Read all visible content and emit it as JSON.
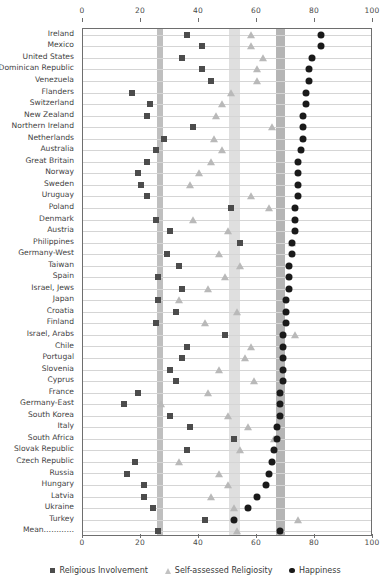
{
  "chart_data": {
    "type": "scatter",
    "title": "",
    "xlabel": "",
    "ylabel": "",
    "xlim": [
      0,
      100
    ],
    "xticks": [
      0,
      20,
      40,
      60,
      80,
      100
    ],
    "grid": true,
    "legend_position": "bottom",
    "orientation": "horizontal-dot-plot",
    "categories": [
      "Ireland",
      "Mexico",
      "United States",
      "Dominican Republic",
      "Venezuela",
      "Flanders",
      "Switzerland",
      "New Zealand",
      "Northern Ireland",
      "Netherlands",
      "Australia",
      "Great Britain",
      "Norway",
      "Sweden",
      "Uruguay",
      "Poland",
      "Denmark",
      "Austria",
      "Philippines",
      "Germany-West",
      "Taiwan",
      "Spain",
      "Israel, Jews",
      "Japan",
      "Croatia",
      "Finland",
      "Israel, Arabs",
      "Chile",
      "Portugal",
      "Slovenia",
      "Cyprus",
      "France",
      "Germany-East",
      "South Korea",
      "Italy",
      "South Africa",
      "Slovak Republic",
      "Czech Republic",
      "Russia",
      "Hungary",
      "Latvia",
      "Ukraine",
      "Turkey",
      "Mean…………"
    ],
    "series": [
      {
        "name": "Religious Involvement",
        "marker": "square",
        "color": "#4c4c4c",
        "values": [
          36,
          41,
          34,
          41,
          44,
          17,
          23,
          22,
          38,
          28,
          25,
          22,
          19,
          20,
          22,
          51,
          25,
          30,
          54,
          29,
          33,
          26,
          34,
          26,
          32,
          25,
          49,
          36,
          34,
          30,
          32,
          19,
          14,
          30,
          37,
          52,
          36,
          18,
          15,
          21,
          21,
          24,
          42,
          26
        ]
      },
      {
        "name": "Self-assessed Religiosity",
        "marker": "triangle",
        "color": "#b9b9b9",
        "values": [
          58,
          58,
          62,
          60,
          60,
          51,
          48,
          46,
          65,
          45,
          48,
          44,
          40,
          37,
          58,
          64,
          38,
          50,
          72,
          47,
          54,
          49,
          43,
          33,
          53,
          42,
          73,
          58,
          56,
          47,
          59,
          43,
          27,
          50,
          57,
          66,
          54,
          33,
          47,
          50,
          44,
          52,
          74,
          53
        ]
      },
      {
        "name": "Happiness",
        "marker": "circle",
        "color": "#1a1a1a",
        "values": [
          82,
          82,
          79,
          78,
          78,
          77,
          77,
          76,
          76,
          76,
          75,
          74,
          74,
          74,
          74,
          73,
          73,
          73,
          72,
          72,
          71,
          71,
          71,
          70,
          70,
          70,
          69,
          69,
          69,
          69,
          69,
          68,
          68,
          68,
          67,
          67,
          66,
          65,
          64,
          63,
          60,
          57,
          52,
          68
        ]
      }
    ],
    "bands": [
      {
        "name": "religious-involvement-mean-band",
        "from": 25.5,
        "to": 27.5,
        "shade": "dark"
      },
      {
        "name": "self-assessed-religiosity-mean-band",
        "from": 50.5,
        "to": 54.0,
        "shade": "light"
      },
      {
        "name": "happiness-mean-band",
        "from": 66.5,
        "to": 69.5,
        "shade": "mid"
      }
    ]
  },
  "legend": {
    "items": [
      {
        "label": "Religious Involvement",
        "marker": "square"
      },
      {
        "label": "Self-assessed Religiosity",
        "marker": "triangle"
      },
      {
        "label": "Happiness",
        "marker": "circle"
      }
    ]
  }
}
